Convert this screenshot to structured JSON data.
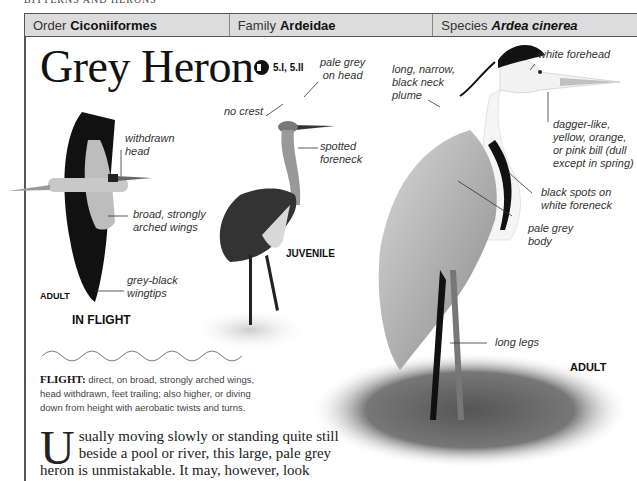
{
  "running_head": "BITTERNS AND HERONS",
  "taxonomy": {
    "order_label": "Order",
    "order_value": "Ciconiiformes",
    "family_label": "Family",
    "family_value": "Ardeidae",
    "species_label": "Species",
    "species_value": "Ardea cinerea"
  },
  "title": "Grey Heron",
  "audio": {
    "icon": "speaker-icon",
    "tracks": "5.I, 5.II"
  },
  "flight_panel": {
    "labels": {
      "withdrawn_head": "withdrawn\nhead",
      "arched_wings": "broad, strongly\narched wings",
      "wingtips": "grey-black\nwingtips"
    },
    "age_tag": "ADULT",
    "caption": "IN FLIGHT"
  },
  "juvenile_panel": {
    "labels": {
      "pale_grey_head": "pale grey\non head",
      "no_crest": "no crest",
      "spotted_foreneck": "spotted\nforeneck"
    },
    "caption": "JUVENILE"
  },
  "adult_panel": {
    "labels": {
      "white_forehead": "white forehead",
      "neck_plume": "long, narrow,\nblack neck\nplume",
      "bill": "dagger-like,\nyellow, orange,\nor pink bill (dull\nexcept in spring)",
      "black_spots": "black spots on\nwhite foreneck",
      "pale_body": "pale grey\nbody",
      "long_legs": "long legs"
    },
    "caption": "ADULT"
  },
  "flight_description": {
    "heading": "FLIGHT:",
    "text": " direct, on broad, strongly arched wings, head withdrawn, feet trailing; also higher, or diving down from height with aerobatic twists and turns."
  },
  "body": {
    "dropcap": "U",
    "text": "sually moving slowly or standing quite still beside a pool or river, this large, pale grey heron is unmistakable. It may, however, look"
  }
}
